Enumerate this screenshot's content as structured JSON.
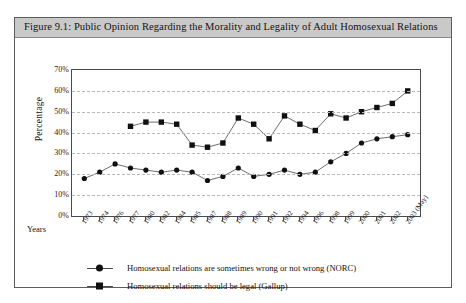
{
  "figure": {
    "title": "Figure 9.1: Public Opinion Regarding the Morality and Legality of Adult Homosexual Relations"
  },
  "axes": {
    "y_title": "Percentage",
    "x_title": "Years",
    "y_ticks": [
      "0%",
      "10%",
      "20%",
      "30%",
      "40%",
      "50%",
      "60%",
      "70%"
    ]
  },
  "legend": {
    "items": [
      {
        "marker": "circle",
        "label": "Homosexual relations are sometimes wrong or not wrong (NORC)"
      },
      {
        "marker": "square",
        "label": "Homosexual relations should be legal (Gallup)"
      }
    ]
  },
  "colors": {
    "title_bar": "#c9c9c9",
    "frame_border": "#5d5d5d",
    "plot_border": "#4a4a4a",
    "gridline": "#b9b9b9",
    "series_line": "#6e6e6e",
    "marker": "#101010"
  },
  "chart_data": {
    "type": "line",
    "title": "Figure 9.1: Public Opinion Regarding the Morality and Legality of Adult Homosexual Relations",
    "xlabel": "Years",
    "ylabel": "Percentage",
    "ylim": [
      0,
      70
    ],
    "ytick_step": 10,
    "grid": true,
    "legend_position": "bottom",
    "categories": [
      "1973",
      "1974",
      "1976",
      "1977",
      "1980",
      "1982",
      "1984",
      "1985",
      "1987",
      "1988",
      "1989",
      "1990",
      "1991",
      "1992",
      "1994",
      "1996",
      "1998",
      "1999",
      "2000",
      "2001",
      "2002",
      "2003 (May)"
    ],
    "series": [
      {
        "name": "Homosexual relations are sometimes wrong or not wrong (NORC)",
        "marker": "circle",
        "values": [
          18,
          21,
          25,
          23,
          22,
          21,
          22,
          21,
          17,
          19,
          23,
          19,
          20,
          22,
          20,
          21,
          26,
          30,
          35,
          37,
          38,
          39
        ]
      },
      {
        "name": "Homosexual relations should be legal (Gallup)",
        "marker": "square",
        "values": [
          null,
          null,
          null,
          43,
          45,
          45,
          44,
          34,
          33,
          35,
          47,
          44,
          37,
          48,
          44,
          41,
          49,
          47,
          50,
          52,
          54,
          60
        ]
      }
    ]
  }
}
